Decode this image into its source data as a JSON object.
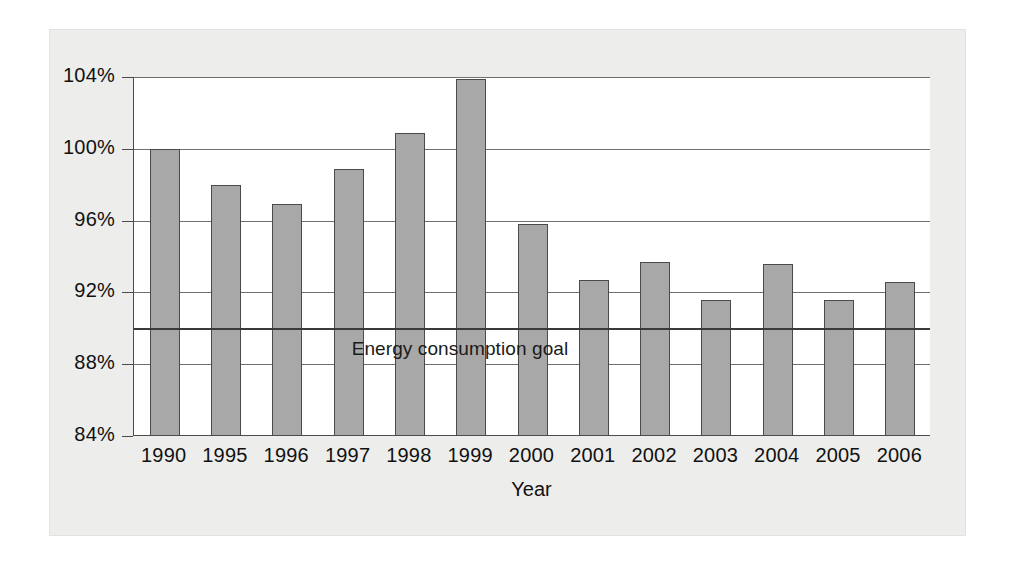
{
  "chart_data": {
    "type": "bar",
    "title": "",
    "xlabel": "Year",
    "ylabel": "",
    "categories": [
      "1990",
      "1995",
      "1996",
      "1997",
      "1998",
      "1999",
      "2000",
      "2001",
      "2002",
      "2003",
      "2004",
      "2005",
      "2006"
    ],
    "values": [
      100.0,
      98.0,
      96.9,
      98.9,
      100.9,
      103.9,
      95.8,
      92.7,
      93.7,
      91.6,
      93.6,
      91.6,
      92.6
    ],
    "value_format": "percent",
    "ylim": [
      84,
      104
    ],
    "yticks": [
      84,
      88,
      92,
      96,
      100,
      104
    ],
    "ytick_labels": [
      "84%",
      "88%",
      "92%",
      "96%",
      "100%",
      "104%"
    ],
    "grid": true,
    "legend": "none",
    "annotations": [
      {
        "name": "energy-consumption-goal",
        "label": "Energy consumption goal",
        "type": "reference-line",
        "value": 90,
        "orientation": "horizontal"
      }
    ]
  },
  "colors": {
    "bar_fill": "#a8a8a8",
    "bar_border": "#4a4a4a",
    "gridline": "#6f6f6f",
    "axis": "#4c4c4c",
    "goal_line": "#3a3a3a",
    "card_background": "#ededeb",
    "plot_background": "#ffffff",
    "text": "#111111"
  }
}
